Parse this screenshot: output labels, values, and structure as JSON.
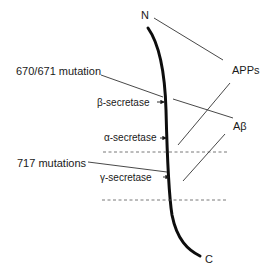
{
  "diagram": {
    "terminals": {
      "n_label": "N",
      "c_label": "C"
    },
    "products": {
      "apps_label": "APPs",
      "abeta_label": "Aβ"
    },
    "mutations": {
      "m670_label": "670/671 mutation",
      "m717_label": "717 mutations"
    },
    "secretases": {
      "beta_label": "β-secretase",
      "alpha_label": "α-secretase",
      "gamma_label": "γ-secretase"
    },
    "colors": {
      "line": "#1a1a1a",
      "thin_line": "#333333",
      "dashed": "#555555",
      "background": "#ffffff"
    }
  }
}
